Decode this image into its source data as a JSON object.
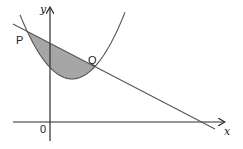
{
  "diagram": {
    "labels": {
      "x_axis": "x",
      "y_axis": "y",
      "origin": "0",
      "point_p": "P",
      "point_q": "Q"
    },
    "colors": {
      "shading": "#a6a6a6",
      "curve": "#555555",
      "axis": "#2a2a2a"
    },
    "elements": [
      {
        "type": "parabola",
        "opening": "up",
        "vertex_side": "right of y-axis, above x-axis"
      },
      {
        "type": "line",
        "gradient": "negative",
        "crosses_x_axis": "positive x"
      },
      {
        "type": "shaded_region",
        "between": [
          "line",
          "parabola"
        ],
        "from": "P",
        "to": "Q"
      }
    ]
  }
}
